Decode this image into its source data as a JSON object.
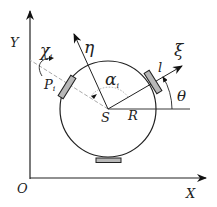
{
  "diagram": {
    "axes": {
      "x_label": "X",
      "y_label": "Y",
      "origin_label": "O"
    },
    "center_label": "S",
    "radius_label": "R",
    "body_frame": {
      "xi_label": "ξ",
      "eta_label": "η"
    },
    "angles": {
      "theta_label": "θ",
      "alpha_label": "α",
      "alpha_sub": "i",
      "chi_label": "χ",
      "chi_sub": "i"
    },
    "wheel_point_label": "P",
    "wheel_point_sub": "i",
    "length_label": "l",
    "colors": {
      "line": "#222222",
      "wheel_fill": "#b8b8b8",
      "dashed": "#aaaaaa"
    }
  }
}
